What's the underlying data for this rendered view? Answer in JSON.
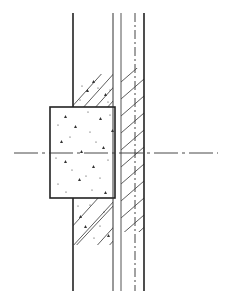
{
  "diagram": {
    "kind": "wall-section-detail",
    "colors": {
      "background": "#ffffff",
      "line": "#222222",
      "thin_line": "#555555",
      "dots": "#333333"
    },
    "elements": {
      "wall_left_edge": {
        "x": 73,
        "y1": 13,
        "y2": 291
      },
      "wall_inner_line": {
        "x": 113,
        "y1": 13,
        "y2": 291
      },
      "layer_line": {
        "x": 121,
        "y1": 13,
        "y2": 291
      },
      "dashed_line": {
        "x": 135,
        "y1": 13,
        "y2": 291
      },
      "wall_right_edge": {
        "x": 144,
        "y1": 13,
        "y2": 291
      },
      "concrete_block": {
        "x": 50,
        "y": 107,
        "w": 65,
        "h": 91
      },
      "upper_hatch_fill": {
        "x": 73,
        "y": 74,
        "w": 40,
        "h": 33
      },
      "lower_hatch_fill": {
        "x": 73,
        "y": 198,
        "w": 40,
        "h": 47
      },
      "right_hatch_band": {
        "x": 121,
        "y": 68,
        "w": 23,
        "h": 164
      },
      "center_axis": {
        "y": 153,
        "x1": 14,
        "x2": 218
      }
    }
  }
}
